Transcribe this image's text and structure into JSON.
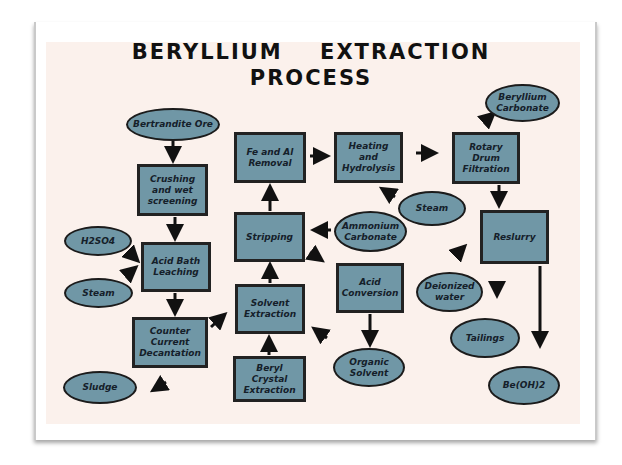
{
  "title": {
    "line1": "BERYLLIUM EXTRACTION",
    "line2": "PROCESS"
  },
  "colors": {
    "node_fill": "#7097a6",
    "node_border": "#1b1b1b",
    "slide_bg": "#fbf1ec",
    "arrow": "#111111"
  },
  "nodes": {
    "bertrandite_ore": "Bertrandite Ore",
    "crushing": "Crushing and wet screening",
    "h2so4": "H2SO4",
    "steam_left": "Steam",
    "acid_bath": "Acid Bath Leaching",
    "counter_current": "Counter Current Decantation",
    "sludge": "Sludge",
    "fe_al_removal": "Fe and Al Removal",
    "stripping": "Stripping",
    "solvent_extraction": "Solvent Extraction",
    "beryl_crystal": "Beryl Crystal Extraction",
    "heating_hydrolysis": "Heating and Hydrolysis",
    "ammonium_carbonate": "Ammonium Carbonate",
    "steam_right": "Steam",
    "acid_conversion": "Acid Conversion",
    "organic_solvent": "Organic Solvent",
    "rotary_drum": "Rotary Drum Filtration",
    "beryllium_carbonate": "Beryllium Carbonate",
    "reslurry": "Reslurry",
    "deionized_water": "Deionized water",
    "tailings": "Tailings",
    "beoh2": "Be(OH)2"
  },
  "edges": [
    [
      "Bertrandite Ore",
      "Crushing and wet screening"
    ],
    [
      "Crushing and wet screening",
      "Acid Bath Leaching"
    ],
    [
      "H2SO4",
      "Acid Bath Leaching"
    ],
    [
      "Steam",
      "Acid Bath Leaching"
    ],
    [
      "Acid Bath Leaching",
      "Counter Current Decantation"
    ],
    [
      "Counter Current Decantation",
      "Sludge"
    ],
    [
      "Counter Current Decantation",
      "Solvent Extraction"
    ],
    [
      "Beryl Crystal Extraction",
      "Solvent Extraction"
    ],
    [
      "Acid Conversion",
      "Solvent Extraction"
    ],
    [
      "Solvent Extraction",
      "Stripping"
    ],
    [
      "Ammonium Carbonate",
      "Stripping"
    ],
    [
      "Stripping",
      "Fe and Al Removal"
    ],
    [
      "Stripping",
      "Acid Conversion"
    ],
    [
      "Acid Conversion",
      "Organic Solvent"
    ],
    [
      "Fe and Al Removal",
      "Heating and Hydrolysis"
    ],
    [
      "Steam",
      "Heating and Hydrolysis"
    ],
    [
      "Heating and Hydrolysis",
      "Rotary Drum Filtration"
    ],
    [
      "Rotary Drum Filtration",
      "Beryllium Carbonate"
    ],
    [
      "Rotary Drum Filtration",
      "Reslurry"
    ],
    [
      "Deionized water",
      "Reslurry"
    ],
    [
      "Deionized water",
      "Tailings"
    ],
    [
      "Reslurry",
      "Be(OH)2"
    ]
  ]
}
